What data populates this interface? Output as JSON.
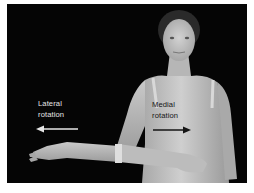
{
  "figure": {
    "background_color": "#050505",
    "skin_color": "#bdbdbd"
  },
  "labels": {
    "lateral": {
      "line1": "Lateral",
      "line2": "rotation",
      "arrow_direction": "left",
      "color": "#e6e6e6"
    },
    "medial": {
      "line1": "Medial",
      "line2": "rotation",
      "arrow_direction": "right",
      "color": "#151515"
    }
  }
}
